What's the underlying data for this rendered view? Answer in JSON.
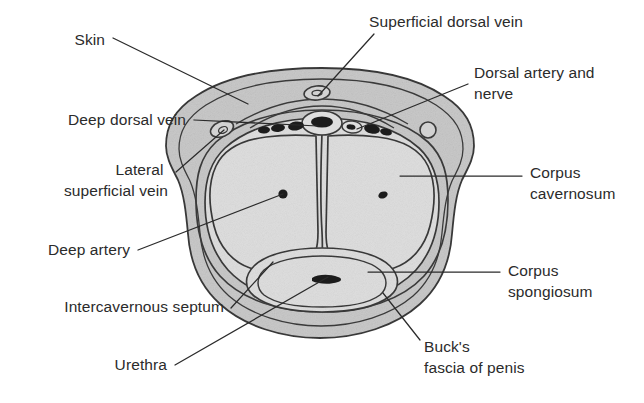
{
  "figure": {
    "type": "anatomical-cross-section",
    "background_color": "#ffffff",
    "line_color": "#3a3a3a",
    "text_color": "#2b2b2b",
    "fill_outer_fascia": "#c9c9c9",
    "fill_skin_band": "#d2d2d2",
    "fill_corpus": "#dedede",
    "fill_vessel_dark": "#1c1c1c"
  },
  "labels": [
    {
      "id": "skin",
      "text": "Skin",
      "side": "left",
      "text_x": 105,
      "text_y": 45,
      "leader": "M113 38 L248 104"
    },
    {
      "id": "deep-dorsal-vein",
      "text": "Deep dorsal vein",
      "side": "left",
      "text_x": 186,
      "text_y": 125,
      "leader": "M194 120 L318 126"
    },
    {
      "id": "lateral-superficial-vein",
      "text": "Lateral superficial vein",
      "side": "left",
      "line1": "Lateral",
      "line2": "superficial vein",
      "text_x": 168,
      "text_y": 175,
      "leader": "M176 172 L224 130"
    },
    {
      "id": "deep-artery",
      "text": "Deep artery",
      "side": "left",
      "text_x": 130,
      "text_y": 255,
      "leader": "M138 250 L283 194"
    },
    {
      "id": "intercavernous-septum",
      "text": "Intercavernous septum",
      "side": "left",
      "text_x": 224,
      "text_y": 312,
      "leader": "M231 308 L273 262"
    },
    {
      "id": "urethra",
      "text": "Urethra",
      "side": "left",
      "text_x": 167,
      "text_y": 370,
      "leader": "M175 365 L328 277"
    },
    {
      "id": "superficial-dorsal-vein",
      "text": "Superficial dorsal vein",
      "side": "top",
      "text_x": 446,
      "text_y": 27,
      "leader": "M374 34 L318 96"
    },
    {
      "id": "dorsal-artery-and-nerve",
      "text": "Dorsal artery and nerve",
      "side": "right",
      "line1": "Dorsal artery and",
      "line2": "nerve",
      "text_x": 474,
      "text_y": 78,
      "leader": "M468 84 L357 129"
    },
    {
      "id": "corpus-cavernosum",
      "text": "Corpus cavernosum",
      "side": "right",
      "line1": "Corpus",
      "line2": "cavernosum",
      "text_x": 530,
      "text_y": 178,
      "leader": "M522 176 L400 176"
    },
    {
      "id": "corpus-spongiosum",
      "text": "Corpus spongiosum",
      "side": "right",
      "line1": "Corpus",
      "line2": "spongiosum",
      "text_x": 508,
      "text_y": 276,
      "leader": "M500 272 L368 272"
    },
    {
      "id": "bucks-fascia-of-penis",
      "text": "Buck's fascia of penis",
      "side": "right",
      "line1": "Buck's",
      "line2": "fascia of penis",
      "text_x": 424,
      "text_y": 352,
      "leader": "M420 340 L383 293"
    }
  ],
  "structures": [
    {
      "id": "skin-outer-boundary",
      "name": "Skin (outer boundary)"
    },
    {
      "id": "dartos-superficial-fascia",
      "name": "Superficial fascia layer"
    },
    {
      "id": "bucks-fascia",
      "name": "Buck's fascia"
    },
    {
      "id": "tunica-albuginea",
      "name": "Tunica albuginea"
    },
    {
      "id": "corpus-cavernosum-left",
      "name": "Left corpus cavernosum"
    },
    {
      "id": "corpus-cavernosum-right",
      "name": "Right corpus cavernosum"
    },
    {
      "id": "corpus-spongiosum",
      "name": "Corpus spongiosum"
    },
    {
      "id": "intercavernous-septum",
      "name": "Intercavernous septum"
    },
    {
      "id": "urethra-lumen",
      "name": "Urethral lumen"
    },
    {
      "id": "deep-artery-left",
      "name": "Left deep (cavernosal) artery"
    },
    {
      "id": "deep-artery-right",
      "name": "Right deep (cavernosal) artery"
    },
    {
      "id": "deep-dorsal-vein",
      "name": "Deep dorsal vein"
    },
    {
      "id": "superficial-dorsal-vein",
      "name": "Superficial dorsal vein"
    },
    {
      "id": "dorsal-artery-left",
      "name": "Left dorsal artery"
    },
    {
      "id": "dorsal-artery-right",
      "name": "Right dorsal artery"
    },
    {
      "id": "dorsal-nerve-left",
      "name": "Left dorsal nerve"
    },
    {
      "id": "dorsal-nerve-right",
      "name": "Right dorsal nerve"
    },
    {
      "id": "lateral-superficial-vein-left",
      "name": "Left lateral superficial vein"
    },
    {
      "id": "lateral-superficial-vein-right",
      "name": "Right lateral superficial vein"
    }
  ]
}
